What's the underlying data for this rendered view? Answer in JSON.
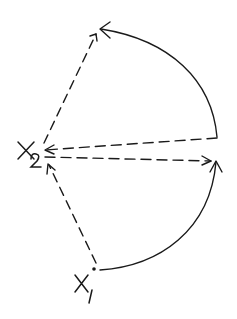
{
  "diagram": {
    "stroke_color": "#1a1a1a",
    "background": "#ffffff",
    "labels": {
      "x2": {
        "main": "X",
        "sub": "2"
      },
      "x1": {
        "main": "X",
        "sub": "1"
      }
    },
    "edges": [
      {
        "id": "x2-to-top",
        "style": "dashed",
        "from": "X2",
        "to": "top-point",
        "arrow": "end"
      },
      {
        "id": "right-to-top",
        "style": "solid-arc",
        "from": "upper-right-point",
        "to": "top-point",
        "arrow": "end"
      },
      {
        "id": "upper-right-to-x2",
        "style": "dashed",
        "from": "upper-right-point",
        "to": "X2",
        "arrow": "end"
      },
      {
        "id": "x2-to-right",
        "style": "dashed",
        "from": "X2",
        "to": "right-point",
        "arrow": "end"
      },
      {
        "id": "x1-to-right",
        "style": "solid-arc",
        "from": "X1",
        "to": "right-point",
        "arrow": "end"
      },
      {
        "id": "x1-to-x2",
        "style": "dashed",
        "from": "X1",
        "to": "X2",
        "arrow": "end"
      }
    ]
  }
}
